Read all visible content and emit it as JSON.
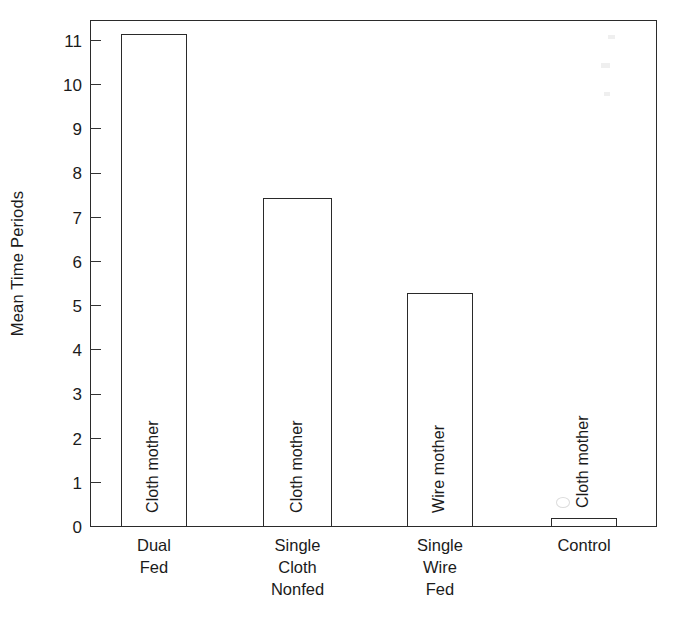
{
  "chart_data": {
    "type": "bar",
    "title": "",
    "subtitle": "",
    "xlabel": "",
    "ylabel": "Mean Time Periods",
    "ylim": [
      0,
      11.5
    ],
    "grid": false,
    "legend": null,
    "yticks": [
      0,
      1,
      2,
      3,
      4,
      5,
      6,
      7,
      8,
      9,
      10,
      11
    ],
    "ytick_labels": [
      "0",
      "1",
      "2",
      "3",
      "4",
      "5",
      "6",
      "7",
      "8",
      "9",
      "10",
      "11"
    ],
    "categories": [
      "Dual\nFed",
      "Single\nCloth\nNonfed",
      "Single\nWire\nFed",
      "Control"
    ],
    "category_lines": [
      [
        "Dual",
        "Fed"
      ],
      [
        "Single",
        "Cloth",
        "Nonfed"
      ],
      [
        "Single",
        "Wire",
        "Fed"
      ],
      [
        "Control"
      ]
    ],
    "values": [
      11.15,
      7.45,
      5.3,
      0.2
    ],
    "bar_labels": [
      "Cloth mother",
      "Cloth mother",
      "Wire mother",
      "Cloth mother"
    ],
    "bar_color": "#ffffff",
    "bar_edge_color": "#2a2a2a",
    "axis_color": "#2b2b2b",
    "text_color": "#1b1b1b"
  },
  "figure": {
    "background": "#ffffff"
  }
}
